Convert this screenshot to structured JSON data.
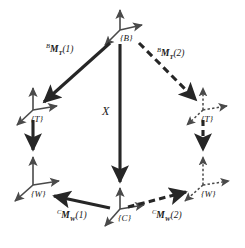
{
  "figure": {
    "background_color": "#ffffff",
    "stroke_color": "#262626",
    "width": 245,
    "height": 248
  },
  "frames": [
    {
      "id": "B",
      "label": "{B}",
      "style": "solid",
      "x": 120,
      "y": 32
    },
    {
      "id": "T-left",
      "label": "{T}",
      "style": "solid",
      "x": 38,
      "y": 113
    },
    {
      "id": "T-right",
      "label": "{T}",
      "style": "dotted",
      "x": 207,
      "y": 113
    },
    {
      "id": "W-left",
      "label": "{W}",
      "style": "solid",
      "x": 38,
      "y": 188
    },
    {
      "id": "W-right",
      "label": "{W}",
      "style": "dotted",
      "x": 207,
      "y": 188
    },
    {
      "id": "C",
      "label": "{C}",
      "style": "solid",
      "x": 120,
      "y": 212
    }
  ],
  "transforms": [
    {
      "id": "B-to-T-1",
      "text": "BM_T(1)",
      "prefix": "B",
      "base": "M",
      "subscript": "T",
      "arg": "(1)",
      "style": "solid",
      "from": "B",
      "to": "T-left",
      "label_x": 46,
      "label_y": 45
    },
    {
      "id": "B-to-T-2",
      "text": "BM_T(2)",
      "prefix": "B",
      "base": "M",
      "subscript": "T",
      "arg": "(2)",
      "style": "dashed",
      "from": "B",
      "to": "T-right",
      "label_x": 157,
      "label_y": 49
    },
    {
      "id": "C-to-W-1",
      "text": "CM_W(1)",
      "prefix": "C",
      "base": "M",
      "subscript": "W",
      "arg": "(1)",
      "style": "solid",
      "from": "C",
      "to": "W-left",
      "label_x": 58,
      "label_y": 211
    },
    {
      "id": "C-to-W-2",
      "text": "CM_W(2)",
      "prefix": "C",
      "base": "M",
      "subscript": "W",
      "arg": "(2)",
      "style": "dashed",
      "from": "C",
      "to": "W-right",
      "label_x": 152,
      "label_y": 211
    },
    {
      "id": "T-to-W-left",
      "text": "",
      "style": "solid",
      "from": "T-left",
      "to": "W-left"
    },
    {
      "id": "T-to-W-right",
      "text": "",
      "style": "dashed",
      "from": "T-right",
      "to": "W-right"
    }
  ],
  "unknown": {
    "id": "X",
    "label": "X",
    "style": "solid",
    "from": "B",
    "to": "C",
    "label_x": 102,
    "label_y": 112
  }
}
